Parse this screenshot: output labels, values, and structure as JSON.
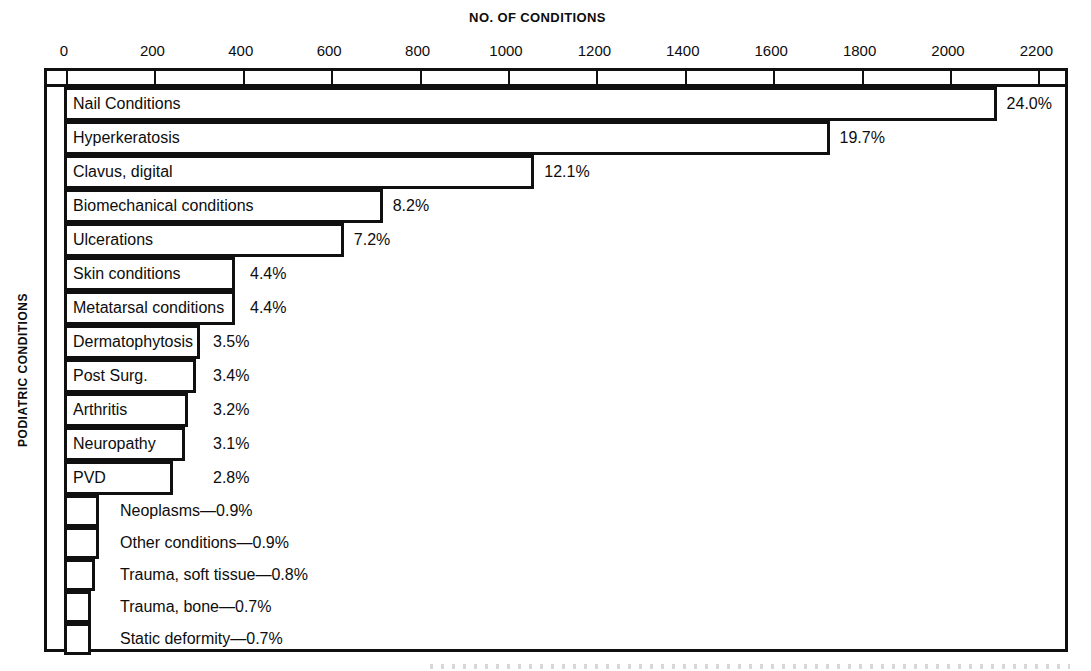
{
  "chart_data": {
    "type": "bar",
    "orientation": "horizontal",
    "title": "NO. OF CONDITIONS",
    "xlabel": "NO. OF CONDITIONS",
    "ylabel": "PODIATRIC CONDITIONS",
    "grid": false,
    "legend": null,
    "xlim": [
      0,
      2200
    ],
    "xticks": [
      0,
      200,
      400,
      600,
      800,
      1000,
      1200,
      1400,
      1600,
      1800,
      2000,
      2200
    ],
    "xtick_labels": [
      "0",
      "200",
      "400",
      "600",
      "800",
      "1000",
      "1200",
      "1400",
      "1600",
      "1800",
      "2000",
      "2200"
    ],
    "categories": [
      "Nail Conditions",
      "Hyperkeratosis",
      "Clavus, digital",
      "Biomechanical conditions",
      "Ulcerations",
      "Skin conditions",
      "Metatarsal conditions",
      "Dermatophytosis",
      "Post Surg.",
      "Arthritis",
      "Neuropathy",
      "PVD",
      "Neoplasms",
      "Other conditions",
      "Trauma, soft tissue",
      "Trauma, bone",
      "Static deformity"
    ],
    "percent_labels": [
      "24.0%",
      "19.7%",
      "12.1%",
      "8.2%",
      "7.2%",
      "4.4%",
      "4.4%",
      "3.5%",
      "3.4%",
      "3.2%",
      "3.1%",
      "2.8%",
      "0.9%",
      "0.9%",
      "0.8%",
      "0.7%",
      "0.7%"
    ],
    "percent_values": [
      24.0,
      19.7,
      12.1,
      8.2,
      7.2,
      4.4,
      4.4,
      3.5,
      3.4,
      3.2,
      3.1,
      2.8,
      0.9,
      0.9,
      0.8,
      0.7,
      0.7
    ],
    "values": [
      2110,
      1732,
      1064,
      721,
      633,
      387,
      387,
      308,
      299,
      281,
      273,
      246,
      79,
      79,
      70,
      62,
      62
    ]
  },
  "axis": {
    "title": "NO. OF CONDITIONS",
    "y_caption": "PODIATRIC CONDITIONS"
  },
  "rows": [
    {
      "label": "Nail Conditions",
      "pct": "24.0%",
      "label_inside": true,
      "value_inside": false
    },
    {
      "label": "Hyperkeratosis",
      "pct": "19.7%",
      "label_inside": true,
      "value_inside": false
    },
    {
      "label": "Clavus, digital",
      "pct": "12.1%",
      "label_inside": true,
      "value_inside": false
    },
    {
      "label": "Biomechanical conditions",
      "pct": "8.2%",
      "label_inside": true,
      "value_inside": false
    },
    {
      "label": "Ulcerations",
      "pct": "7.2%",
      "label_inside": true,
      "value_inside": false
    },
    {
      "label": "Skin conditions",
      "pct": "4.4%",
      "label_inside": true,
      "value_inside": false
    },
    {
      "label": "Metatarsal conditions",
      "pct": "4.4%",
      "label_inside": true,
      "value_inside": false
    },
    {
      "label": "Dermatophytosis",
      "pct": "3.5%",
      "label_inside": true,
      "value_inside": false
    },
    {
      "label": "Post Surg.",
      "pct": "3.4%",
      "label_inside": true,
      "value_inside": false
    },
    {
      "label": "Arthritis",
      "pct": "3.2%",
      "label_inside": true,
      "value_inside": false
    },
    {
      "label": "Neuropathy",
      "pct": "3.1%",
      "label_inside": true,
      "value_inside": false
    },
    {
      "label": "PVD",
      "pct": "2.8%",
      "label_inside": true,
      "value_inside": false
    },
    {
      "label": "Neoplasms—0.9%",
      "pct": "0.9%",
      "label_inside": false,
      "value_inside": false
    },
    {
      "label": "Other conditions—0.9%",
      "pct": "0.9%",
      "label_inside": false,
      "value_inside": false
    },
    {
      "label": "Trauma, soft tissue—0.8%",
      "pct": "0.8%",
      "label_inside": false,
      "value_inside": false
    },
    {
      "label": "Trauma, bone—0.7%",
      "pct": "0.7%",
      "label_inside": false,
      "value_inside": false
    },
    {
      "label": "Static deformity—0.7%",
      "pct": "0.7%",
      "label_inside": false,
      "value_inside": false
    }
  ],
  "colors": {
    "ink": "#101010",
    "paper": "#ffffff"
  }
}
